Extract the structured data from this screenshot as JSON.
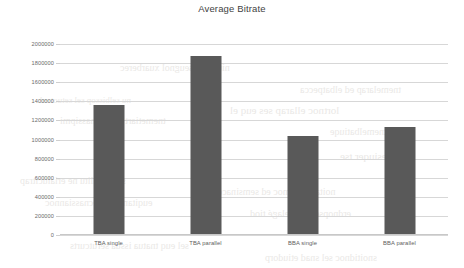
{
  "chart_data": {
    "type": "bar",
    "title": "Average Bitrate",
    "xlabel": "",
    "ylabel": "",
    "categories": [
      "TBA single",
      "TBA parallel",
      "BBA single",
      "BBA parallel"
    ],
    "values": [
      1360000,
      1875000,
      1035000,
      1130000
    ],
    "ylim": [
      0,
      2000000
    ],
    "ytick_labels": [
      "2000000",
      "1800000",
      "1600000",
      "1400000",
      "1200000",
      "1000000",
      "800000",
      "600000",
      "400000",
      "200000",
      "0"
    ],
    "ytick_values": [
      2000000,
      1800000,
      1600000,
      1400000,
      1200000,
      1000000,
      800000,
      600000,
      400000,
      200000,
      0
    ],
    "grid": true,
    "legend": false,
    "legend_position": "none",
    "series": [
      {
        "name": "Average Bitrate",
        "values": [
          1360000,
          1875000,
          1035000,
          1130000
        ]
      }
    ]
  },
  "colors": {
    "bar": "#595959",
    "grid": "#d7d7d7",
    "axis": "#c8c8c8",
    "title_text": "#3f3f3f",
    "tick_text": "#6b6b6b",
    "background": "#ffffff",
    "bleed_text": "#d9d6d2"
  },
  "background_bleed": {
    "lines": [
      {
        "text": "niupe ne seugnol xuarberec",
        "x": 120,
        "y": 62,
        "size": 10
      },
      {
        "text": "tnemelarap ed elbatpecca",
        "x": 300,
        "y": 84,
        "size": 10
      },
      {
        "text": "nu selbissop sel setuot ed",
        "x": 40,
        "y": 95,
        "size": 9
      },
      {
        "text": "lortnoc ellarap ses euq el",
        "x": 230,
        "y": 104,
        "size": 11
      },
      {
        "text": "tnemetiart el rus tnassipmi",
        "x": 60,
        "y": 115,
        "size": 10
      },
      {
        "text": "tnemelbatiuqe",
        "x": 330,
        "y": 126,
        "size": 10
      },
      {
        "text": "esiuqer tse",
        "x": 340,
        "y": 150,
        "size": 11
      },
      {
        "text": "sel tnasilitu ne erialucitrap",
        "x": 20,
        "y": 175,
        "size": 10
      },
      {
        "text": "noitacinummoc ed semsinacem",
        "x": 210,
        "y": 186,
        "size": 10
      },
      {
        "text": "euqitametsys ecnassiannoc",
        "x": 45,
        "y": 197,
        "size": 10
      },
      {
        "text": "erdnopser tnemelagé tiod",
        "x": 250,
        "y": 208,
        "size": 10
      },
      {
        "text": "sel euq tnatua issua serutcurts",
        "x": 70,
        "y": 240,
        "size": 10
      },
      {
        "text": "snoitidnoc sel snad etiudorp",
        "x": 265,
        "y": 252,
        "size": 10
      }
    ]
  }
}
